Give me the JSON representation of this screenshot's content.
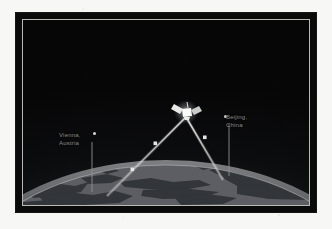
{
  "figure": {
    "kind": "space-illustration",
    "background_color": "#f7f7f5",
    "frame_color": "#0a0a0a",
    "inner_rule_color": "#b9b9b4",
    "space_color": "#0b0c0d",
    "earth_color": "#8f9196",
    "beam_color": "#cfd2cf",
    "label_color": "#8d8d87"
  },
  "scene": {
    "satellite": {
      "name": "satellite",
      "icon": "satellite-icon",
      "x": 163,
      "y": 92
    },
    "stations": [
      {
        "id": "vienna",
        "icon": "ground-station-marker-icon",
        "label_lines": [
          "Vienna,",
          "Austria"
        ],
        "city": "Vienna",
        "country": "Austria",
        "marker_x": 84,
        "marker_y": 114,
        "ground_x": 84,
        "ground_y": 176
      },
      {
        "id": "beijing",
        "icon": "ground-station-marker-icon",
        "label_lines": [
          "Beijing,",
          "China"
        ],
        "city": "Beijing",
        "country": "China",
        "marker_x": 200,
        "marker_y": 96,
        "ground_x": 200,
        "ground_y": 160
      }
    ],
    "beams": [
      {
        "id": "beam-vienna",
        "from": "satellite",
        "to": "vienna",
        "waypoints": [
          {
            "x": 133,
            "y": 124
          },
          {
            "x": 110,
            "y": 150
          }
        ]
      },
      {
        "id": "beam-beijing",
        "from": "satellite",
        "to": "beijing",
        "waypoints": [
          {
            "x": 182,
            "y": 118
          }
        ]
      }
    ],
    "earth": {
      "name": "earth-limb",
      "horizon_label": "",
      "landmass_tone": "#33363a",
      "surface_tone": "#93959a"
    }
  }
}
